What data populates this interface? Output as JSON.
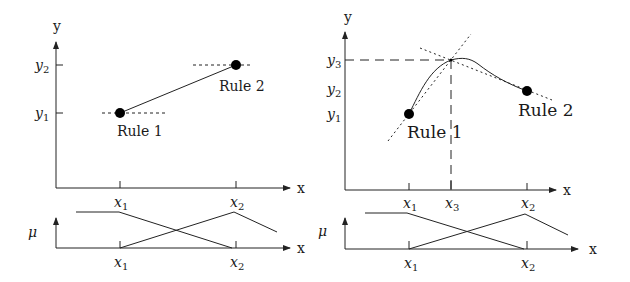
{
  "left_panel": {
    "y_axis_label": "y",
    "x_axis_label": "x",
    "y_ticks": [
      {
        "base": "y",
        "sub": "2"
      },
      {
        "base": "y",
        "sub": "1"
      }
    ],
    "x_ticks": [
      {
        "base": "x",
        "sub": "1"
      },
      {
        "base": "x",
        "sub": "2"
      }
    ],
    "rules": [
      {
        "label": "Rule 1",
        "x": "x1",
        "y": "y1"
      },
      {
        "label": "Rule 2",
        "x": "x2",
        "y": "y2"
      }
    ],
    "membership": {
      "mu_label": "μ",
      "x_axis_label": "x",
      "x_ticks": [
        {
          "base": "x",
          "sub": "1"
        },
        {
          "base": "x",
          "sub": "2"
        }
      ]
    }
  },
  "right_panel": {
    "y_axis_label": "y",
    "x_axis_label": "x",
    "y_ticks": [
      {
        "base": "y",
        "sub": "3"
      },
      {
        "base": "y",
        "sub": "2"
      },
      {
        "base": "y",
        "sub": "1"
      }
    ],
    "x_ticks": [
      {
        "base": "x",
        "sub": "1"
      },
      {
        "base": "x",
        "sub": "3"
      },
      {
        "base": "x",
        "sub": "2"
      }
    ],
    "rules": [
      {
        "label": "Rule 1",
        "x": "x1",
        "y": "y1"
      },
      {
        "label": "Rule 2",
        "x": "x2",
        "y": "y2"
      }
    ],
    "membership": {
      "mu_label": "μ",
      "x_axis_label": "x",
      "x_ticks": [
        {
          "base": "x",
          "sub": "1"
        },
        {
          "base": "x",
          "sub": "2"
        }
      ]
    }
  }
}
